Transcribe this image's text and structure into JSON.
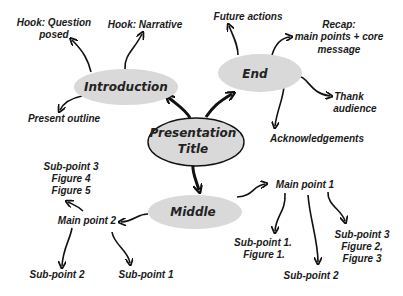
{
  "colors": {
    "ellipse_fill": "#d9d9d9",
    "ellipse_stroke": "#111111",
    "text": "#1a1a1a",
    "background": "#ffffff"
  },
  "center": {
    "line1": "Presentation",
    "line2": "Title"
  },
  "nodes": {
    "introduction": {
      "label": "Introduction"
    },
    "end": {
      "label": "End"
    },
    "middle": {
      "label": "Middle"
    }
  },
  "introduction_children": {
    "hook_question": {
      "line1": "Hook: Question",
      "line2": "posed"
    },
    "hook_narrative": {
      "line1": "Hook: Narrative"
    },
    "present_outline": {
      "line1": "Present outline"
    }
  },
  "end_children": {
    "future_actions": {
      "line1": "Future actions"
    },
    "recap": {
      "line1": "Recap:",
      "line2": "main points + core",
      "line3": "message"
    },
    "thank_audience": {
      "line1": "Thank",
      "line2": "audience"
    },
    "acknowledgements": {
      "line1": "Acknowledgements"
    }
  },
  "middle_children": {
    "main_point_1": {
      "label": "Main point 1",
      "children": {
        "sub1": {
          "line1": "Sub-point 1.",
          "line2": "Figure 1."
        },
        "sub2": {
          "line1": "Sub-point 2"
        },
        "sub3": {
          "line1": "Sub-point 3",
          "line2": "Figure 2,",
          "line3": "Figure 3"
        }
      }
    },
    "main_point_2": {
      "label": "Main point 2",
      "children": {
        "sub3": {
          "line1": "Sub-point 3",
          "line2": "Figure 4",
          "line3": "Figure 5"
        },
        "sub2": {
          "line1": "Sub-point 2"
        },
        "sub1": {
          "line1": "Sub-point 1"
        }
      }
    }
  }
}
